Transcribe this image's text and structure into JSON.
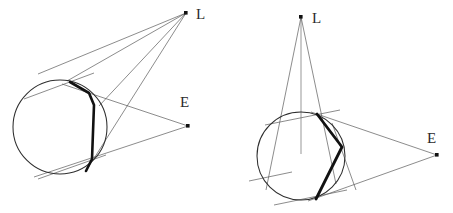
{
  "figure": {
    "background_color": "#ffffff",
    "stroke_color_thin": "#4a4a4a",
    "stroke_color_thick": "#111111",
    "point_color": "#111111",
    "label_color": "#2b2b2b",
    "panels": [
      {
        "id": "left-panel",
        "name": "left-diagram",
        "circle": {
          "cx": 60,
          "cy": 127,
          "r": 47
        },
        "points": [
          {
            "name": "L",
            "label": "L",
            "x": 186,
            "y": 13,
            "label_x": 196,
            "label_y": 18
          },
          {
            "name": "E",
            "label": "E",
            "x": 188,
            "y": 126,
            "label_x": 180,
            "label_y": 101
          }
        ],
        "tangent_points": [
          {
            "name": "upper-tangency",
            "x": 70,
            "y": 82
          },
          {
            "name": "mid-tangency",
            "x": 97,
            "y": 102
          },
          {
            "name": "lower-tangency",
            "x": 86,
            "y": 170
          }
        ],
        "thick_path_vertices": [
          {
            "x": 70,
            "y": 82
          },
          {
            "x": 90,
            "y": 94
          },
          {
            "x": 94,
            "y": 104
          },
          {
            "x": 91,
            "y": 160
          },
          {
            "x": 86,
            "y": 170
          }
        ],
        "rays_from_L": [
          {
            "from": "L",
            "to_x": 40,
            "to_y": 74
          },
          {
            "from": "L",
            "to_x": 62,
            "to_y": 79
          },
          {
            "from": "L",
            "to_x": 86,
            "to_y": 170
          },
          {
            "from": "L",
            "to_x": 97,
            "to_y": 103
          }
        ],
        "rays_from_E": [
          {
            "from": "E",
            "to_x": 64,
            "to_y": 84
          },
          {
            "from": "E",
            "to_x": 36,
            "to_y": 176
          }
        ],
        "tangent_segments": [
          {
            "name": "upper-tangent-line",
            "x1": 24,
            "y1": 99,
            "x2": 92,
            "y2": 74
          },
          {
            "name": "lower-tangent-line",
            "x1": 40,
            "y1": 178,
            "x2": 105,
            "y2": 156
          }
        ]
      },
      {
        "id": "right-panel",
        "name": "right-diagram",
        "circle": {
          "cx": 301,
          "cy": 156,
          "r": 44
        },
        "points": [
          {
            "name": "L",
            "label": "L",
            "x": 301,
            "y": 17,
            "label_x": 312,
            "label_y": 20
          },
          {
            "name": "E",
            "label": "E",
            "x": 437,
            "y": 155,
            "label_x": 427,
            "label_y": 137
          }
        ],
        "tangent_points": [
          {
            "name": "upper-tangency",
            "x": 318,
            "y": 114
          },
          {
            "name": "mid-tangency",
            "x": 344,
            "y": 148
          },
          {
            "name": "lower-tangency",
            "x": 316,
            "y": 198
          }
        ],
        "thick_path_vertices": [
          {
            "x": 318,
            "y": 114
          },
          {
            "x": 341,
            "y": 146
          },
          {
            "x": 316,
            "y": 198
          }
        ],
        "rays_from_L": [
          {
            "from": "L",
            "to_x": 268,
            "to_y": 188
          },
          {
            "from": "L",
            "to_x": 301,
            "to_y": 153
          },
          {
            "from": "L",
            "to_x": 334,
            "to_y": 182
          }
        ],
        "rays_from_E": [
          {
            "from": "E",
            "to_x": 312,
            "to_y": 112
          },
          {
            "from": "E",
            "to_x": 310,
            "to_y": 200
          }
        ],
        "tangent_segments": [
          {
            "name": "upper-tangent-line",
            "x1": 266,
            "y1": 124,
            "x2": 338,
            "y2": 111
          },
          {
            "name": "mid-tangent-line",
            "x1": 333,
            "y1": 124,
            "x2": 354,
            "y2": 189
          },
          {
            "name": "left-tangent-line",
            "x1": 250,
            "y1": 180,
            "x2": 290,
            "y2": 172
          },
          {
            "name": "lower-tangent-line",
            "x1": 276,
            "y1": 204,
            "x2": 345,
            "y2": 190
          }
        ]
      }
    ]
  }
}
